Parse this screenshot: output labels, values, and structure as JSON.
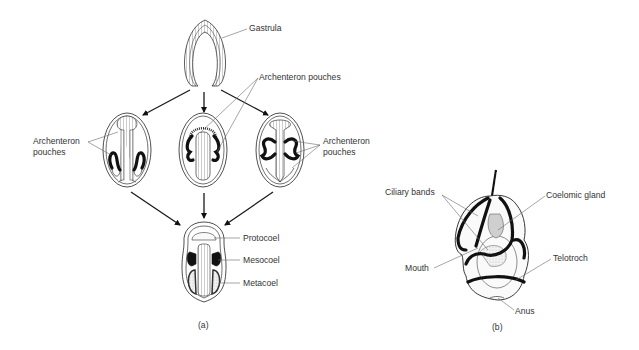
{
  "figure": {
    "panel_a": {
      "caption": "(a)",
      "labels": {
        "gastrula": "Gastrula",
        "archenteron_pouches_left": [
          "Archenteron",
          "pouches"
        ],
        "archenteron_pouches_center": "Archenteron pouches",
        "archenteron_pouches_right": [
          "Archenteron",
          "pouches"
        ],
        "protocoel": "Protocoel",
        "mesocoel": "Mesocoel",
        "metacoel": "Metacoel"
      },
      "stages": [
        "gastrula",
        "left-pouching-embryo",
        "center-pouching-embryo",
        "right-pouching-embryo",
        "tripartite-coelom-embryo"
      ]
    },
    "panel_b": {
      "caption": "(b)",
      "labels": {
        "ciliary_bands": "Ciliary bands",
        "coelomic_gland": "Coelomic gland",
        "mouth": "Mouth",
        "telotroch": "Telotroch",
        "anus": "Anus"
      }
    }
  }
}
